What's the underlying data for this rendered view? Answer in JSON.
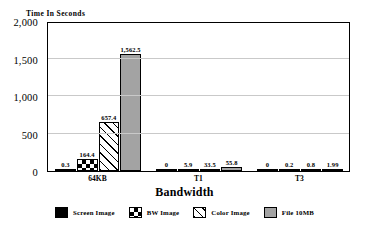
{
  "chart_data": {
    "type": "bar",
    "title": "",
    "ylabel": "Time In Seconds",
    "xlabel": "Bandwidth",
    "categories": [
      "64KB",
      "T1",
      "T3"
    ],
    "ylim": [
      0,
      2000
    ],
    "yticks": [
      "0",
      "500",
      "1,000",
      "1,500",
      "2,000"
    ],
    "ytick_values": [
      0,
      500,
      1000,
      1500,
      2000
    ],
    "grid": true,
    "legend_position": "bottom",
    "series": [
      {
        "name": "Screen Image",
        "pattern": "solid-black",
        "values": [
          0.3,
          0,
          0
        ],
        "labels": [
          "0.3",
          "0",
          "0"
        ]
      },
      {
        "name": "BW Image",
        "pattern": "checker",
        "values": [
          164.4,
          5.9,
          0.2
        ],
        "labels": [
          "164.4",
          "5.9",
          "0.2"
        ]
      },
      {
        "name": "Color Image",
        "pattern": "hatch",
        "values": [
          657.4,
          33.5,
          0.8
        ],
        "labels": [
          "657.4",
          "33.5",
          "0.8"
        ]
      },
      {
        "name": "File 10MB",
        "pattern": "gray",
        "values": [
          1562.5,
          55.8,
          1.99
        ],
        "labels": [
          "1,562.5",
          "55.8",
          "1.99"
        ]
      }
    ]
  },
  "colors": {
    "series_gray": "#a3a3a3",
    "series_black": "#000000",
    "grid": "#c9c9c9",
    "axis": "#000000",
    "background": "#ffffff"
  }
}
